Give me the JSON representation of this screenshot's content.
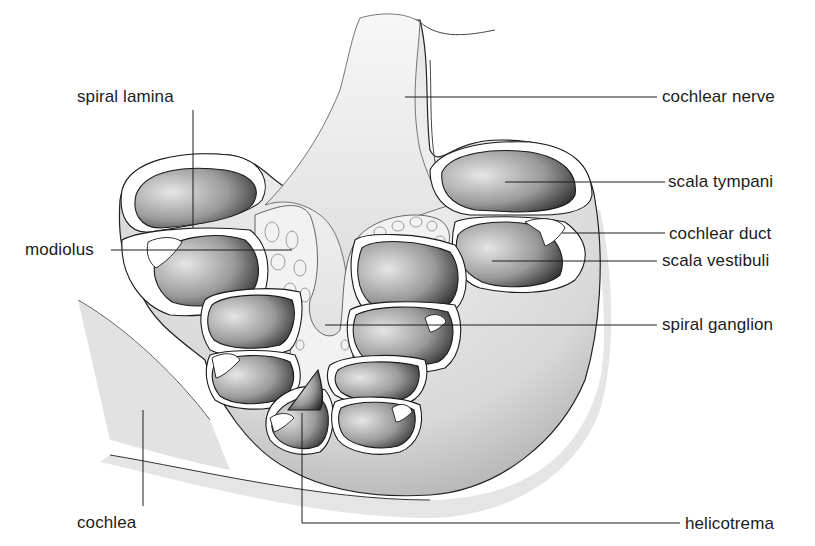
{
  "figure": {
    "colors": {
      "ink": "#1c1c1c",
      "stipple_dark": "#2a2a2a",
      "stipple_light": "#bdbdbd",
      "background": "#ffffff"
    }
  },
  "labels": {
    "spiral_lamina": "spiral lamina",
    "modiolus": "modiolus",
    "cochlea": "cochlea",
    "cochlear_nerve": "cochlear nerve",
    "scala_tympani": "scala tympani",
    "cochlear_duct": "cochlear duct",
    "scala_vestibuli": "scala vestibuli",
    "spiral_ganglion": "spiral ganglion",
    "helicotrema": "helicotrema"
  }
}
